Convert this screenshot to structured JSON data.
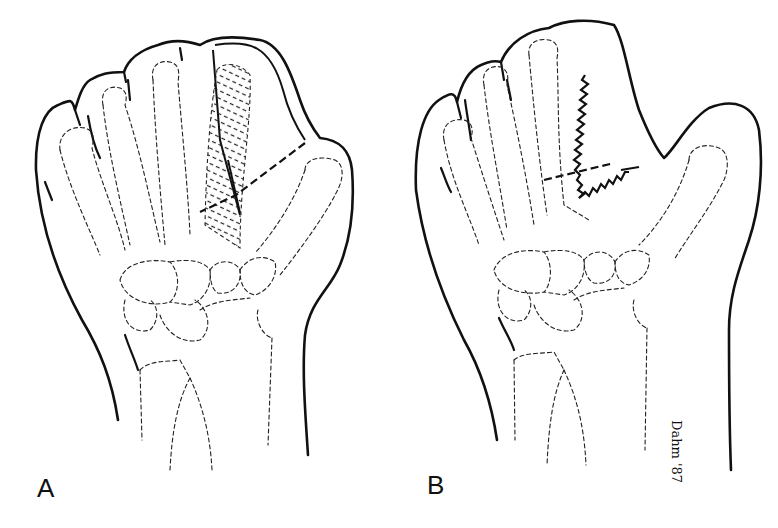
{
  "figure": {
    "panels": [
      {
        "id": "A",
        "label": "A",
        "description": "Dorsal hand outline with dashed skeletal bones; hatched index ray region with dashed incision lines toward thumb"
      },
      {
        "id": "B",
        "label": "B",
        "description": "Hand after pollicization/web reconstruction with zig-zag suture lines between index and thumb"
      }
    ],
    "signature": "Dahm '87",
    "colors": {
      "ink": "#111111",
      "background": "#ffffff"
    }
  }
}
